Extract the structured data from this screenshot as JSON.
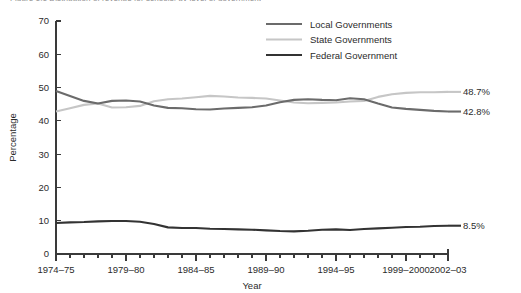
{
  "figure": {
    "title_clipped": "Figure 1.1   Distribution of revenue for schools, by level of government"
  },
  "chart_data": {
    "type": "line",
    "title": "",
    "xlabel": "Year",
    "ylabel": "Percentage",
    "ylim": [
      0,
      70
    ],
    "yticks": [
      0,
      10,
      20,
      30,
      40,
      50,
      60,
      70
    ],
    "grid": false,
    "legend_position": "top-right",
    "x": [
      "1974-75",
      "1975-76",
      "1976-77",
      "1977-78",
      "1978-79",
      "1979-80",
      "1980-81",
      "1981-82",
      "1982-83",
      "1983-84",
      "1984-85",
      "1985-86",
      "1986-87",
      "1987-88",
      "1988-89",
      "1989-90",
      "1990-91",
      "1991-92",
      "1992-93",
      "1993-94",
      "1994-95",
      "1995-96",
      "1996-97",
      "1997-98",
      "1998-99",
      "1999-2000",
      "2000-01",
      "2001-02",
      "2002-03"
    ],
    "xtick_labels": [
      "1974–75",
      "1979–80",
      "1984–85",
      "1989–90",
      "1994–95",
      "1999–2000",
      "2002–03"
    ],
    "xtick_indices": [
      0,
      5,
      10,
      15,
      20,
      25,
      28
    ],
    "series": [
      {
        "name": "Local Governments",
        "color": "#6b6b6b",
        "end_label": "42.8%",
        "values": [
          49.0,
          47.5,
          46.0,
          45.2,
          46.0,
          46.1,
          45.8,
          44.6,
          43.9,
          43.8,
          43.5,
          43.4,
          43.7,
          43.9,
          44.1,
          44.6,
          45.6,
          46.3,
          46.5,
          46.3,
          46.2,
          46.8,
          46.5,
          45.2,
          44.0,
          43.6,
          43.3,
          43.0,
          42.8
        ]
      },
      {
        "name": "State Governments",
        "color": "#c6c6c6",
        "end_label": "48.7%",
        "values": [
          42.8,
          43.8,
          44.8,
          45.2,
          44.0,
          44.1,
          44.5,
          45.9,
          46.5,
          46.7,
          47.1,
          47.5,
          47.3,
          47.0,
          46.9,
          46.7,
          46.1,
          45.5,
          45.3,
          45.4,
          45.5,
          45.8,
          46.0,
          47.2,
          48.0,
          48.4,
          48.6,
          48.6,
          48.7
        ]
      },
      {
        "name": "Federal Government",
        "color": "#333333",
        "end_label": "8.5%",
        "values": [
          9.3,
          9.5,
          9.6,
          9.8,
          9.9,
          9.9,
          9.7,
          9.0,
          8.0,
          7.8,
          7.8,
          7.6,
          7.5,
          7.4,
          7.3,
          7.1,
          6.9,
          6.8,
          7.0,
          7.3,
          7.4,
          7.2,
          7.5,
          7.7,
          7.9,
          8.1,
          8.2,
          8.4,
          8.5
        ]
      }
    ]
  }
}
